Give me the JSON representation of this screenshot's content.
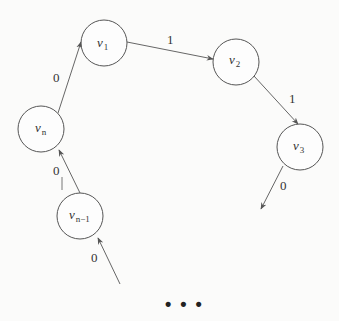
{
  "diagram": {
    "type": "state-cycle",
    "nodes": [
      {
        "id": "v1",
        "base": "v",
        "sub": "1"
      },
      {
        "id": "v2",
        "base": "v",
        "sub": "2"
      },
      {
        "id": "v3",
        "base": "v",
        "sub": "3"
      },
      {
        "id": "vn",
        "base": "v",
        "sub": "n"
      },
      {
        "id": "vn_1",
        "base": "v",
        "sub": "n−1"
      }
    ],
    "edges": [
      {
        "from": "vn",
        "to": "v1",
        "label": "0"
      },
      {
        "from": "v1",
        "to": "v2",
        "label": "1"
      },
      {
        "from": "v2",
        "to": "v3",
        "label": "1"
      },
      {
        "from": "v3",
        "to": "continuation",
        "label": "0"
      },
      {
        "from": "vn_1",
        "to": "vn",
        "label": "0"
      },
      {
        "from": "continuation",
        "to": "vn_1",
        "label": "0"
      }
    ],
    "ellipsis": "• • •"
  }
}
